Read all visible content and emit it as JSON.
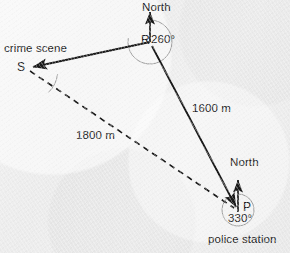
{
  "figure": {
    "type": "bearings-diagram",
    "background_color": "#efefef",
    "ink_color": "#1a1a1a",
    "arc_color": "#8f8f8f",
    "points": [
      {
        "id": "S",
        "label": "S",
        "name": "crime scene",
        "x": 28,
        "y": 68
      },
      {
        "id": "R",
        "label": "R",
        "name": "",
        "x": 150,
        "y": 42
      },
      {
        "id": "P",
        "label": "P",
        "name": "police station",
        "x": 238,
        "y": 210
      }
    ],
    "place_labels": {
      "crime_scene": "crime scene",
      "police_station": "police station"
    },
    "compass_labels": {
      "north_at_r": "North",
      "north_at_p": "North"
    },
    "bearings": [
      {
        "at": "R",
        "value": "260°",
        "from": "North",
        "to": "S",
        "sweep": "clockwise"
      },
      {
        "at": "P",
        "value": "330°",
        "from": "North",
        "to": "R",
        "sweep": "clockwise"
      }
    ],
    "distances": [
      {
        "label": "1600 m",
        "from": "R",
        "to": "P",
        "style": "solid"
      },
      {
        "label": "1800 m",
        "from": "S",
        "to": "P",
        "style": "dashed"
      }
    ],
    "segments": [
      {
        "from": "R",
        "to": "S",
        "style": "solid",
        "arrow": "end"
      },
      {
        "from": "R",
        "to": "P",
        "style": "solid",
        "arrow": "end"
      },
      {
        "from": "S",
        "to": "P",
        "style": "dashed",
        "arrow": "none"
      },
      {
        "from": "R",
        "to": "North",
        "style": "solid",
        "arrow": "end"
      },
      {
        "from": "P",
        "to": "North",
        "style": "solid",
        "arrow": "end"
      }
    ],
    "angle_marks": [
      {
        "at": "S",
        "value": "",
        "labeled": false
      }
    ]
  }
}
